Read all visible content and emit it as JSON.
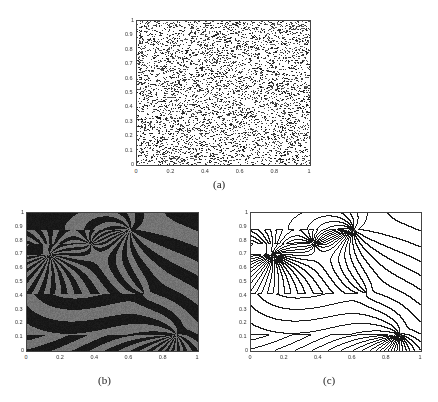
{
  "figure": {
    "panels": [
      {
        "id": "a",
        "caption": "(a)",
        "description": "random initial dot pattern",
        "box": {
          "left": 136,
          "top": 20,
          "width": 173,
          "height": 144
        },
        "caption_pos": {
          "left": 213,
          "top": 178
        }
      },
      {
        "id": "b",
        "caption": "(b)",
        "description": "grayscale stripe pattern with defects",
        "box": {
          "left": 26,
          "top": 212,
          "width": 171,
          "height": 138
        },
        "caption_pos": {
          "left": 98,
          "top": 374
        }
      },
      {
        "id": "c",
        "caption": "(c)",
        "description": "stripe contour lines with defects",
        "box": {
          "left": 250,
          "top": 212,
          "width": 170,
          "height": 138
        },
        "caption_pos": {
          "left": 323,
          "top": 374
        }
      }
    ],
    "x_ticks": [
      "0",
      "0.2",
      "0.4",
      "0.6",
      "0.8",
      "1"
    ],
    "y_ticks": [
      "0",
      "0.1",
      "0.2",
      "0.3",
      "0.4",
      "0.5",
      "0.6",
      "0.7",
      "0.8",
      "0.9",
      "1"
    ],
    "colors": {
      "dots": "#222222",
      "stripe_dark": "#141414",
      "stripe_light": "#6a6a6a",
      "contour": "#1a1a1a",
      "axis": "#444444"
    }
  },
  "chart_data": [
    {
      "type": "scatter",
      "title": "(a)",
      "xlabel": "",
      "ylabel": "",
      "xlim": [
        0,
        1
      ],
      "ylim": [
        0,
        1
      ],
      "x_ticks": [
        0,
        0.2,
        0.4,
        0.6,
        0.8,
        1
      ],
      "y_ticks": [
        0,
        0.1,
        0.2,
        0.3,
        0.4,
        0.5,
        0.6,
        0.7,
        0.8,
        0.9,
        1
      ],
      "grid": false,
      "series": [
        {
          "name": "random points",
          "distribution": "uniform",
          "approx_count": 5000
        }
      ]
    },
    {
      "type": "heatmap",
      "title": "(b)",
      "xlim": [
        0,
        1
      ],
      "ylim": [
        0,
        1
      ],
      "x_ticks": [
        0,
        0.2,
        0.4,
        0.6,
        0.8,
        1
      ],
      "y_ticks": [
        0,
        0.1,
        0.2,
        0.3,
        0.4,
        0.5,
        0.6,
        0.7,
        0.8,
        0.9,
        1
      ],
      "grid": false,
      "colormap": "gray",
      "defects": [
        {
          "x": 0.13,
          "y": 0.7,
          "charge": 1
        },
        {
          "x": 0.6,
          "y": 0.88,
          "charge": 1
        },
        {
          "x": 0.87,
          "y": 0.12,
          "charge": 1
        },
        {
          "x": 0.68,
          "y": 0.42,
          "charge": -0.5
        },
        {
          "x": 0.37,
          "y": 0.78,
          "charge": -0.5
        }
      ],
      "stripe_wavenumber": 110
    },
    {
      "type": "line",
      "title": "(c)",
      "xlim": [
        0,
        1
      ],
      "ylim": [
        0,
        1
      ],
      "x_ticks": [
        0,
        0.2,
        0.4,
        0.6,
        0.8,
        1
      ],
      "y_ticks": [
        0,
        0.1,
        0.2,
        0.3,
        0.4,
        0.5,
        0.6,
        0.7,
        0.8,
        0.9,
        1
      ],
      "grid": false,
      "description": "zero-level contours of the stripe field in (b)",
      "defects": [
        {
          "x": 0.13,
          "y": 0.7,
          "charge": 1
        },
        {
          "x": 0.6,
          "y": 0.88,
          "charge": 1
        },
        {
          "x": 0.87,
          "y": 0.12,
          "charge": 1
        },
        {
          "x": 0.68,
          "y": 0.42,
          "charge": -0.5
        },
        {
          "x": 0.37,
          "y": 0.78,
          "charge": -0.5
        }
      ]
    }
  ]
}
